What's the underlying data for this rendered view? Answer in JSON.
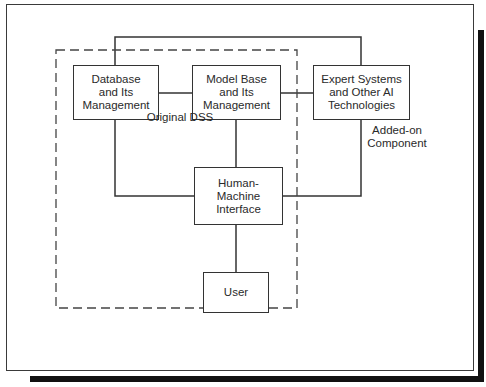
{
  "diagram": {
    "nodes": {
      "database": {
        "label": "Database\nand Its\nManagement"
      },
      "model_base": {
        "label": "Model Base\nand Its\nManagement"
      },
      "expert_systems": {
        "label": "Expert Systems\nand Other AI\nTechnologies"
      },
      "hmi": {
        "label": "Human-\nMachine\nInterface"
      },
      "user": {
        "label": "User"
      }
    },
    "annotations": {
      "added_on": "Added-on\nComponent",
      "original_dss": "Original DSS"
    },
    "edges": [
      {
        "from": "database",
        "to": "model_base"
      },
      {
        "from": "model_base",
        "to": "expert_systems"
      },
      {
        "from": "database",
        "to": "expert_systems",
        "route": "over-top"
      },
      {
        "from": "database",
        "to": "hmi"
      },
      {
        "from": "model_base",
        "to": "hmi"
      },
      {
        "from": "expert_systems",
        "to": "hmi"
      },
      {
        "from": "hmi",
        "to": "user"
      }
    ],
    "groups": [
      {
        "name": "Original DSS",
        "style": "dashed",
        "contains": [
          "database",
          "model_base",
          "hmi",
          "user"
        ]
      }
    ]
  }
}
